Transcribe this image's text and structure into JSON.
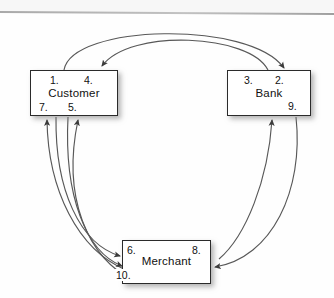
{
  "diagram": {
    "nodes": [
      {
        "id": "customer",
        "label": "Customer",
        "step_numbers": [
          "1.",
          "4.",
          "7.",
          "5."
        ]
      },
      {
        "id": "bank",
        "label": "Bank",
        "step_numbers": [
          "3.",
          "2.",
          "9."
        ]
      },
      {
        "id": "merchant",
        "label": "Merchant",
        "step_numbers": [
          "6.",
          "8.",
          "10."
        ]
      }
    ],
    "customer": {
      "label": "Customer",
      "n1": "1.",
      "n4": "4.",
      "n7": "7.",
      "n5": "5."
    },
    "bank": {
      "label": "Bank",
      "n3": "3.",
      "n2": "2.",
      "n9": "9."
    },
    "merchant": {
      "label": "Merchant",
      "n6": "6.",
      "n8": "8.",
      "n10": "10."
    },
    "edges": [
      {
        "id": "cust-to-bank",
        "from": "Customer",
        "to": "Bank",
        "side": "top-outer"
      },
      {
        "id": "bank-to-cust",
        "from": "Bank",
        "to": "Customer",
        "side": "top-inner"
      },
      {
        "id": "mer-to-cust-a",
        "from": "Merchant",
        "to": "Customer",
        "side": "left-outer"
      },
      {
        "id": "mer-to-cust-b",
        "from": "Merchant",
        "to": "Customer",
        "side": "left-inner"
      },
      {
        "id": "cust-to-mer-a",
        "from": "Customer",
        "to": "Merchant",
        "side": "left-mid-1"
      },
      {
        "id": "cust-to-mer-b",
        "from": "Customer",
        "to": "Merchant",
        "side": "left-mid-2"
      },
      {
        "id": "mer-to-bank",
        "from": "Merchant",
        "to": "Bank",
        "side": "right-inner"
      },
      {
        "id": "bank-to-mer",
        "from": "Bank",
        "to": "Merchant",
        "side": "right-outer"
      }
    ],
    "style": {
      "line_color": "#4a4a4a",
      "box_border_color": "#2b2b2b",
      "text_color": "#111111",
      "background": "#ffffff"
    }
  }
}
